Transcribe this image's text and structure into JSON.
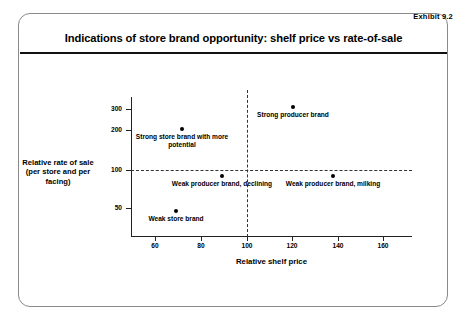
{
  "exhibit": {
    "label": "Exhibit 9.2"
  },
  "title": "Indications of store brand opportunity: shelf price vs rate-of-sale",
  "chart_data": {
    "type": "scatter",
    "title": "Indications of store brand opportunity: shelf price vs rate-of-sale",
    "xlabel": "Relative shelf price",
    "ylabel": "Relative rate of sale (per store and per facing)",
    "xlim": [
      50,
      170
    ],
    "ylim": [
      40,
      330
    ],
    "xticks": [
      60,
      80,
      100,
      120,
      140,
      160
    ],
    "xticklabels": [
      "60",
      "80",
      "100",
      "120",
      "140",
      "160"
    ],
    "yticks": [
      50,
      100,
      200,
      300
    ],
    "yticklabels": [
      "50",
      "100",
      "200",
      "300"
    ],
    "grid": false,
    "legend": "none",
    "reference_lines": [
      {
        "orientation": "horizontal",
        "value": 100,
        "style": "dashed"
      },
      {
        "orientation": "vertical",
        "value": 100,
        "style": "dashed"
      }
    ],
    "points": [
      {
        "label": "Strong store brand with more potential",
        "x": 89,
        "y": 200,
        "label_position": "below"
      },
      {
        "label": "Strong producer brand",
        "x": 122,
        "y": 300,
        "label_position": "below"
      },
      {
        "label": "Weak producer brand, declining",
        "x": 93,
        "y": 90,
        "label_position": "below"
      },
      {
        "label": "Weak producer brand, milking",
        "x": 139,
        "y": 90,
        "label_position": "below"
      },
      {
        "label": "Weak store brand",
        "x": 70,
        "y": 48,
        "label_position": "below"
      }
    ]
  },
  "points_px": [
    {
      "dot_left": 182,
      "dot_top": 129,
      "label_left": 182,
      "label_top": 133
    },
    {
      "dot_left": 293,
      "dot_top": 107,
      "label_left": 293,
      "label_top": 111
    },
    {
      "dot_left": 222,
      "dot_top": 176,
      "label_left": 222,
      "label_top": 180
    },
    {
      "dot_left": 333,
      "dot_top": 176,
      "label_left": 333,
      "label_top": 180
    },
    {
      "dot_left": 176,
      "dot_top": 211,
      "label_left": 176,
      "label_top": 215
    }
  ],
  "ticks_px": {
    "y": [
      {
        "value": "300",
        "top": 109
      },
      {
        "value": "200",
        "top": 130
      },
      {
        "value": "100",
        "top": 170
      },
      {
        "value": "50",
        "top": 208
      }
    ],
    "x": [
      {
        "value": "60",
        "left": 155
      },
      {
        "value": "80",
        "left": 201
      },
      {
        "value": "100",
        "left": 247
      },
      {
        "value": "120",
        "left": 292
      },
      {
        "value": "140",
        "left": 338
      },
      {
        "value": "160",
        "left": 383
      }
    ]
  },
  "reference_px": {
    "horizontal_top": 170,
    "vertical_left": 247
  }
}
